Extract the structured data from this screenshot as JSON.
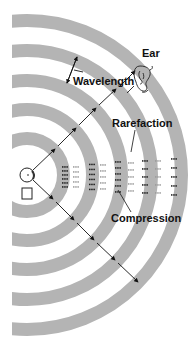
{
  "diagram": {
    "labels": {
      "ear": "Ear",
      "wavelength": "Wavelength",
      "rarefaction": "Rarefaction",
      "compression": "Compression"
    },
    "colors": {
      "ring": "#b4b4b4",
      "dark_dot": "#1a1a1a",
      "light_dot": "#9a9a9a",
      "line": "#111111",
      "background": "#ffffff"
    },
    "source": {
      "cx": 27,
      "cy": 175,
      "r": 7
    },
    "rings": [
      {
        "r_outer": 43,
        "width": 13
      },
      {
        "r_outer": 72,
        "width": 13
      },
      {
        "r_outer": 101,
        "width": 13
      },
      {
        "r_outer": 131,
        "width": 13
      },
      {
        "r_outer": 161,
        "width": 13
      }
    ]
  }
}
